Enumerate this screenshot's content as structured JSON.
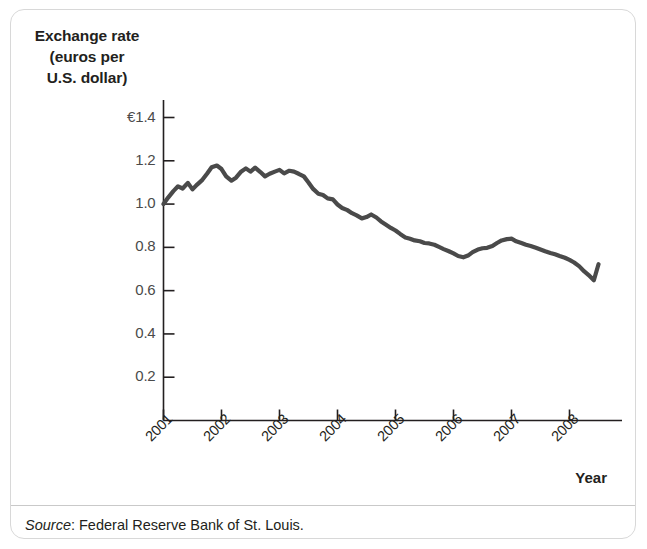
{
  "figure": {
    "y_axis_title_lines": [
      "Exchange rate",
      "(euros per",
      "U.S. dollar)"
    ],
    "x_axis_title": "Year",
    "source_label": "Source",
    "source_separator": ": ",
    "source_text": "Federal Reserve Bank of St. Louis.",
    "line_color": "#4a4a4a",
    "axis_color": "#231f20",
    "border_color": "#d8d8d8"
  },
  "chart_data": {
    "type": "line",
    "title": "",
    "xlabel": "Year",
    "ylabel": "Exchange rate (euros per U.S. dollar)",
    "ylim": [
      0,
      1.5
    ],
    "xlim": [
      2001,
      2008.6
    ],
    "grid": false,
    "legend": null,
    "ytick_labels": [
      "€1.4",
      "1.2",
      "1.0",
      "0.8",
      "0.6",
      "0.4",
      "0.2"
    ],
    "ytick_values": [
      1.4,
      1.2,
      1.0,
      0.8,
      0.6,
      0.4,
      0.2
    ],
    "xtick_labels": [
      "2001",
      "2002",
      "2003",
      "2004",
      "2005",
      "2006",
      "2007",
      "2008"
    ],
    "xtick_values": [
      2001,
      2002,
      2003,
      2004,
      2005,
      2006,
      2007,
      2008
    ],
    "series": [
      {
        "name": "Euros per U.S. dollar",
        "x": [
          2001.0,
          2001.08,
          2001.17,
          2001.25,
          2001.33,
          2001.42,
          2001.5,
          2001.58,
          2001.67,
          2001.75,
          2001.83,
          2001.92,
          2002.0,
          2002.08,
          2002.17,
          2002.25,
          2002.33,
          2002.42,
          2002.5,
          2002.58,
          2002.67,
          2002.75,
          2002.83,
          2002.92,
          2003.0,
          2003.08,
          2003.17,
          2003.25,
          2003.33,
          2003.42,
          2003.5,
          2003.58,
          2003.67,
          2003.75,
          2003.83,
          2003.92,
          2004.0,
          2004.08,
          2004.17,
          2004.25,
          2004.33,
          2004.42,
          2004.5,
          2004.58,
          2004.67,
          2004.75,
          2004.83,
          2004.92,
          2005.0,
          2005.08,
          2005.17,
          2005.25,
          2005.33,
          2005.42,
          2005.5,
          2005.58,
          2005.67,
          2005.75,
          2005.83,
          2005.92,
          2006.0,
          2006.08,
          2006.17,
          2006.25,
          2006.33,
          2006.42,
          2006.5,
          2006.58,
          2006.67,
          2006.75,
          2006.83,
          2006.92,
          2007.0,
          2007.08,
          2007.17,
          2007.25,
          2007.33,
          2007.42,
          2007.5,
          2007.58,
          2007.67,
          2007.75,
          2007.83,
          2007.92,
          2008.0,
          2008.08,
          2008.17,
          2008.25,
          2008.33,
          2008.42,
          2008.5
        ],
        "y": [
          1.0,
          1.03,
          1.06,
          1.082,
          1.072,
          1.098,
          1.068,
          1.09,
          1.112,
          1.14,
          1.17,
          1.178,
          1.162,
          1.128,
          1.108,
          1.122,
          1.148,
          1.165,
          1.15,
          1.168,
          1.148,
          1.128,
          1.14,
          1.15,
          1.158,
          1.142,
          1.154,
          1.15,
          1.14,
          1.128,
          1.1,
          1.07,
          1.048,
          1.042,
          1.026,
          1.022,
          0.998,
          0.982,
          0.972,
          0.958,
          0.948,
          0.934,
          0.94,
          0.952,
          0.938,
          0.92,
          0.906,
          0.89,
          0.878,
          0.862,
          0.846,
          0.84,
          0.832,
          0.828,
          0.82,
          0.818,
          0.812,
          0.802,
          0.792,
          0.782,
          0.772,
          0.76,
          0.754,
          0.762,
          0.778,
          0.79,
          0.796,
          0.798,
          0.806,
          0.82,
          0.832,
          0.838,
          0.84,
          0.828,
          0.82,
          0.812,
          0.806,
          0.798,
          0.79,
          0.782,
          0.774,
          0.768,
          0.76,
          0.752,
          0.742,
          0.73,
          0.712,
          0.69,
          0.672,
          0.648,
          0.722
        ]
      }
    ]
  }
}
